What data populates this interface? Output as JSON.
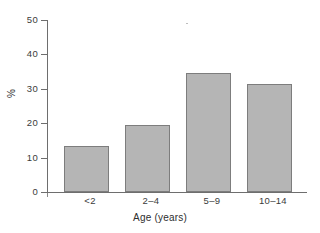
{
  "chart_data": {
    "type": "bar",
    "title": "",
    "subtitle": "",
    "xlabel": "Age (years)",
    "ylabel": "%",
    "categories": [
      "<2",
      "2–4",
      "5–9",
      "10–14"
    ],
    "values": [
      13.5,
      19.5,
      34.5,
      31.3
    ],
    "series": [
      {
        "name": "percent",
        "values": [
          13.5,
          19.5,
          34.5,
          31.3
        ]
      }
    ],
    "ylim": [
      0,
      50
    ],
    "yticks": [
      0,
      10,
      20,
      30,
      40,
      50
    ],
    "ytick_labels": [
      "0",
      "10",
      "20",
      "30",
      "40",
      "50"
    ],
    "grid": false,
    "legend": null,
    "legend_position": "none",
    "bar_fill_color": "#b5b5b5",
    "bar_edge_color": "#7d7d7d",
    "axis_color": "#6e6e6e",
    "background_color": "#ffffff",
    "annotations": []
  }
}
